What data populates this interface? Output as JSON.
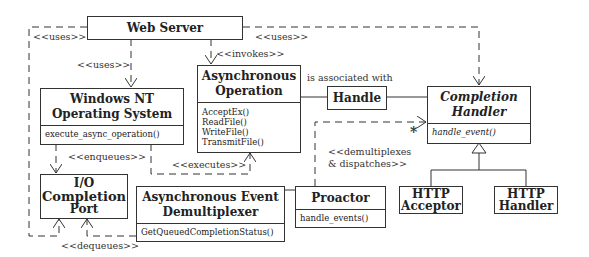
{
  "classes": {
    "web_server": {
      "name": "Web Server"
    },
    "windows_nt": {
      "name_line1": "Windows NT",
      "name_line2": "Operating System",
      "operations": [
        "execute_async_operation()"
      ]
    },
    "async_operation": {
      "name_line1": "Asynchronous",
      "name_line2": "Operation",
      "operations": [
        "AcceptEx()",
        "ReadFile()",
        "WriteFile()",
        "TransmitFile()"
      ]
    },
    "handle": {
      "name": "Handle"
    },
    "completion_handler": {
      "name_line1": "Completion",
      "name_line2": "Handler",
      "operations": [
        "handle_event()"
      ]
    },
    "io_completion_port": {
      "name_line1": "I/O",
      "name_line2": "Completion",
      "name_line3": "Port"
    },
    "async_event_demux": {
      "name_line1": "Asynchronous Event",
      "name_line2": "Demultiplexer",
      "operations": [
        "GetQueuedCompletionStatus()"
      ]
    },
    "proactor": {
      "name": "Proactor",
      "operations": [
        "handle_events()"
      ]
    },
    "http_acceptor": {
      "name_line1": "HTTP",
      "name_line2": "Acceptor"
    },
    "http_handler": {
      "name_line1": "HTTP",
      "name_line2": "Handler"
    }
  },
  "relations": {
    "uses_left": "<<uses>>",
    "uses_nt": "<<uses>>",
    "uses_right": "<<uses>>",
    "invokes": "<<invokes>>",
    "associated": "is associated with",
    "enqueues": "<<enqueues>>",
    "executes": "<<executes>>",
    "dequeues": "<<dequeues>>",
    "demux_line1": "<<demultiplexes",
    "demux_line2": "& dispatches>>",
    "multiplicity": "*"
  },
  "colors": {
    "line": "#333333",
    "background": "#ffffff"
  }
}
